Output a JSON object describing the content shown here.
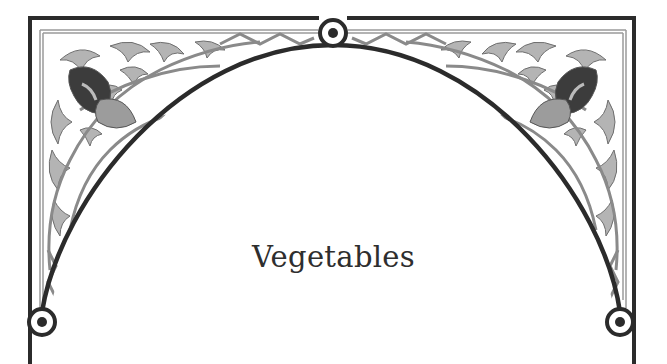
{
  "page": {
    "title": "Vegetables"
  },
  "frame": {
    "style": "ornamental-arch",
    "colors": {
      "outline": "#2b2b2b",
      "ornament_fill": "#b4b4b4",
      "ornament_stroke": "#6e6e6e",
      "accent_dark": "#3c3c3c",
      "background": "#ffffff"
    },
    "icons": [
      "top-medallion-icon",
      "left-medallion-icon",
      "right-medallion-icon",
      "left-corner-flower-icon",
      "right-corner-flower-icon"
    ]
  }
}
